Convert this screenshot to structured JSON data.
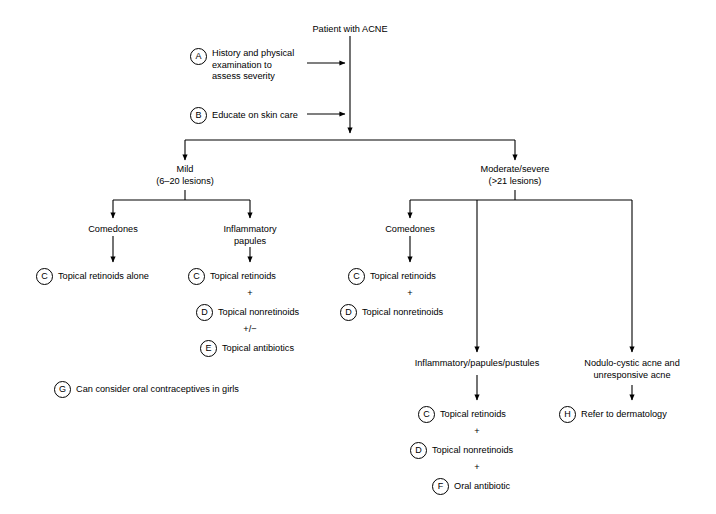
{
  "diagram": {
    "root": {
      "label": "Patient with ACNE"
    },
    "steps": [
      {
        "letter": "A",
        "label": "History and physical\nexamination to\nassess severity"
      },
      {
        "letter": "B",
        "label": "Educate on skin care"
      }
    ],
    "step_a_lines": [
      "History and physical",
      "examination to",
      "assess severity"
    ],
    "branches": {
      "mild": {
        "title": "Mild",
        "subtitle": "(6–20 lesions)"
      },
      "moderate": {
        "title": "Moderate/severe",
        "subtitle": "(>21 lesions)"
      }
    },
    "mild_children": {
      "comedones": {
        "label": "Comedones"
      },
      "inflammatory": {
        "line1": "Inflammatory",
        "line2": "papules"
      }
    },
    "moderate_children": {
      "comedones": {
        "label": "Comedones"
      },
      "inflammatory": {
        "label": "Inflammatory/papules/pustules"
      },
      "nodulocystic": {
        "line1": "Nodulo-cystic acne and",
        "line2": "unresponsive acne"
      }
    },
    "treatments": {
      "mild_comedones": [
        {
          "letter": "C",
          "label": "Topical retinoids alone"
        }
      ],
      "mild_inflammatory": [
        {
          "letter": "C",
          "label": "Topical retinoids"
        },
        {
          "letter": "D",
          "label": "Topical nonretinoids"
        },
        {
          "letter": "E",
          "label": "Topical antibiotics"
        }
      ],
      "mild_inflammatory_connectors": [
        "+",
        "+/−"
      ],
      "moderate_comedones": [
        {
          "letter": "C",
          "label": "Topical retinoids"
        },
        {
          "letter": "D",
          "label": "Topical nonretinoids"
        }
      ],
      "moderate_comedones_connectors": [
        "+"
      ],
      "moderate_inflammatory": [
        {
          "letter": "C",
          "label": "Topical retinoids"
        },
        {
          "letter": "D",
          "label": "Topical nonretinoids"
        },
        {
          "letter": "F",
          "label": "Oral antibiotic"
        }
      ],
      "moderate_inflammatory_connectors": [
        "+",
        "+"
      ],
      "nodulocystic": [
        {
          "letter": "H",
          "label": "Refer to dermatology"
        }
      ]
    },
    "notes": [
      {
        "letter": "G",
        "label": "Can consider oral contraceptives in girls"
      }
    ],
    "colors": {
      "line": "#000000",
      "text": "#000000",
      "background": "#ffffff"
    }
  }
}
